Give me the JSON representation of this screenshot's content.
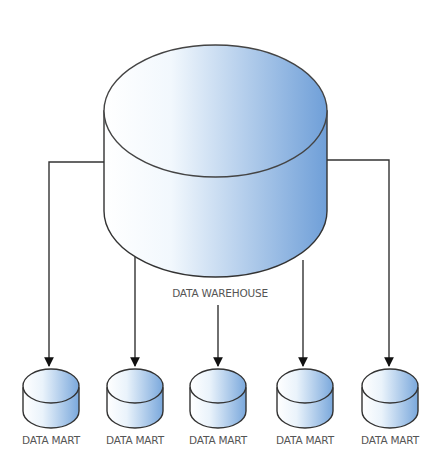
{
  "diagram": {
    "central": {
      "label": "DATA WAREHOUSE",
      "icon": "database-cylinder-icon"
    },
    "marts": [
      {
        "label": "DATA MART",
        "cx": 51
      },
      {
        "label": "DATA MART",
        "cx": 135
      },
      {
        "label": "DATA MART",
        "cx": 218
      },
      {
        "label": "DATA MART",
        "cx": 305
      },
      {
        "label": "DATA MART",
        "cx": 390
      }
    ],
    "colors": {
      "fill_light": "#ffffff",
      "fill_dark": "#6f9fd8",
      "stroke": "#333333",
      "text": "#555555"
    }
  }
}
